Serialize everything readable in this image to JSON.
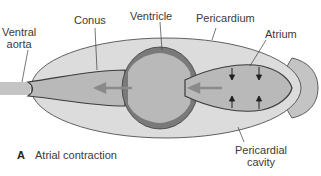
{
  "figure": {
    "panel_letter": "A",
    "caption": "Atrial contraction"
  },
  "labels": {
    "ventral_aorta": [
      "Ventral",
      "aorta"
    ],
    "conus": "Conus",
    "ventricle": "Ventricle",
    "pericardium": "Pericardium",
    "atrium": "Atrium",
    "pericardial_cavity": [
      "Pericardial",
      "cavity"
    ]
  },
  "colors": {
    "pericardial_cavity_fill": "#dcdcdc",
    "chamber_fill": "#b9b9b9",
    "ventricle_wall": "#7a7a7a",
    "outline": "#3c3c3c",
    "flow_arrow": "#8a8a8a",
    "sinus_fill": "#c4c4c4"
  }
}
